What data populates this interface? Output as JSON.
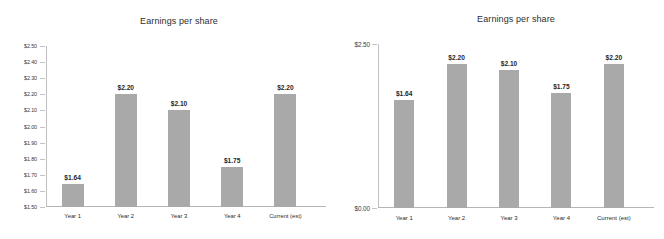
{
  "chart_data": [
    {
      "type": "bar",
      "title": "Earnings per share",
      "xlabel": "",
      "ylabel": "",
      "categories": [
        "Year 1",
        "Year 2",
        "Year 3",
        "Year 4",
        "Current (est)"
      ],
      "values": [
        1.64,
        2.2,
        2.1,
        1.75,
        2.2
      ],
      "data_labels": [
        "$1.64",
        "$2.20",
        "$2.10",
        "$1.75",
        "$2.20"
      ],
      "ylim": [
        1.5,
        2.5
      ],
      "ytick_values": [
        1.5,
        1.6,
        1.7,
        1.8,
        1.9,
        2.0,
        2.1,
        2.2,
        2.3,
        2.4,
        2.5
      ],
      "ytick_labels": [
        "$1.50",
        "$1.60",
        "$1.70",
        "$1.80",
        "$1.90",
        "$2.00",
        "$2.10",
        "$2.20",
        "$2.30",
        "$2.40",
        "$2.50"
      ],
      "grid": false,
      "legend": false,
      "bar_color": "#a9a9a9",
      "axis_color": "#bfbfbf"
    },
    {
      "type": "bar",
      "title": "Earnings per share",
      "xlabel": "",
      "ylabel": "",
      "categories": [
        "Year 1",
        "Year 2",
        "Year 3",
        "Year 4",
        "Current (est)"
      ],
      "values": [
        1.64,
        2.2,
        2.1,
        1.75,
        2.2
      ],
      "data_labels": [
        "$1.64",
        "$2.20",
        "$2.10",
        "$1.75",
        "$2.20"
      ],
      "ylim": [
        0.0,
        2.5
      ],
      "ytick_values": [
        0.0,
        2.5
      ],
      "ytick_labels": [
        "$0.00",
        "$2.50"
      ],
      "grid": false,
      "legend": false,
      "bar_color": "#a9a9a9",
      "axis_color": "#bfbfbf"
    }
  ]
}
